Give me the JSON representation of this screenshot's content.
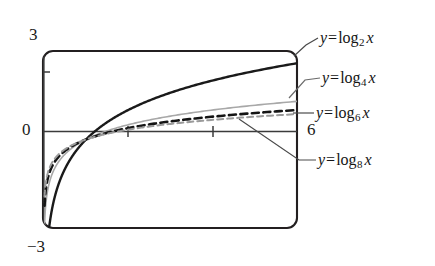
{
  "figure": {
    "kind": "graphing-calculator-plot",
    "background_color": "#ffffff",
    "frame_color": "#231f20",
    "axis_color": "#3b3b3b"
  },
  "axes": {
    "y_top_label": "3",
    "y_zero_label": "0",
    "y_bottom_label": "−3",
    "x_right_label": "6"
  },
  "labels": {
    "log2": {
      "y": "y",
      "equals": "=",
      "fname": "log",
      "base": "2",
      "arg": "x"
    },
    "log4": {
      "y": "y",
      "equals": "=",
      "fname": "log",
      "base": "4",
      "arg": "x"
    },
    "log6": {
      "y": "y",
      "equals": "=",
      "fname": "log",
      "base": "6",
      "arg": "x"
    },
    "log8": {
      "y": "y",
      "equals": "=",
      "fname": "log",
      "base": "8",
      "arg": "x"
    }
  },
  "chart_data": {
    "type": "line",
    "title": "",
    "xlabel": "",
    "ylabel": "",
    "xlim": [
      0,
      6
    ],
    "ylim": [
      -3,
      3
    ],
    "grid": false,
    "legend_position": "right-callouts",
    "x_ticks": [
      2,
      4
    ],
    "y_ticks": [
      2
    ],
    "x_tick_labels": [
      "",
      ""
    ],
    "y_tick_labels": [
      ""
    ],
    "annotations": [
      {
        "text": "3",
        "position": "above-left-of-frame"
      },
      {
        "text": "0",
        "position": "left-of-y-axis-origin"
      },
      {
        "text": "−3",
        "position": "below-left-of-frame"
      },
      {
        "text": "6",
        "position": "right-of-x-axis-end"
      }
    ],
    "series": [
      {
        "name": "y = log_2 x",
        "base": 2,
        "color": "#1a1a1a",
        "style": "solid",
        "width": 2.4,
        "x": [
          0.03,
          0.06,
          0.1,
          0.15,
          0.2,
          0.3,
          0.4,
          0.5,
          0.65,
          0.8,
          1.0,
          1.25,
          1.5,
          1.8,
          2.2,
          2.6,
          3.0,
          3.5,
          4.0,
          4.5,
          5.0,
          5.5,
          6.0
        ],
        "y": [
          -5.06,
          -4.06,
          -3.32,
          -2.74,
          -2.32,
          -1.74,
          -1.32,
          -1.0,
          -0.62,
          -0.32,
          0.0,
          0.32,
          0.58,
          0.85,
          1.14,
          1.38,
          1.58,
          1.81,
          2.0,
          2.17,
          2.32,
          2.46,
          2.58
        ]
      },
      {
        "name": "y = log_4 x",
        "base": 4,
        "color": "#a8a8a8",
        "style": "solid",
        "width": 1.6,
        "x": [
          0.03,
          0.06,
          0.1,
          0.15,
          0.2,
          0.3,
          0.4,
          0.5,
          0.65,
          0.8,
          1.0,
          1.25,
          1.5,
          1.8,
          2.2,
          2.6,
          3.0,
          3.5,
          4.0,
          4.5,
          5.0,
          5.5,
          6.0
        ],
        "y": [
          -2.53,
          -2.03,
          -1.66,
          -1.37,
          -1.16,
          -0.87,
          -0.66,
          -0.5,
          -0.31,
          -0.16,
          0.0,
          0.16,
          0.29,
          0.42,
          0.57,
          0.69,
          0.79,
          0.9,
          1.0,
          1.08,
          1.16,
          1.23,
          1.29
        ]
      },
      {
        "name": "y = log_6 x",
        "base": 6,
        "color": "#141414",
        "style": "dashed",
        "width": 2.6,
        "x": [
          0.03,
          0.06,
          0.1,
          0.15,
          0.2,
          0.3,
          0.4,
          0.5,
          0.65,
          0.8,
          1.0,
          1.25,
          1.5,
          1.8,
          2.2,
          2.6,
          3.0,
          3.5,
          4.0,
          4.5,
          5.0,
          5.5,
          6.0
        ],
        "y": [
          -1.96,
          -1.57,
          -1.29,
          -1.06,
          -0.9,
          -0.67,
          -0.51,
          -0.39,
          -0.24,
          -0.12,
          0.0,
          0.12,
          0.23,
          0.33,
          0.44,
          0.53,
          0.61,
          0.7,
          0.77,
          0.84,
          0.9,
          0.95,
          1.0
        ]
      },
      {
        "name": "y = log_8 x",
        "base": 8,
        "color": "#9a9a9a",
        "style": "dashed",
        "width": 2.0,
        "x": [
          0.03,
          0.06,
          0.1,
          0.15,
          0.2,
          0.3,
          0.4,
          0.5,
          0.65,
          0.8,
          1.0,
          1.25,
          1.5,
          1.8,
          2.2,
          2.6,
          3.0,
          3.5,
          4.0,
          4.5,
          5.0,
          5.5,
          6.0
        ],
        "y": [
          -1.69,
          -1.35,
          -1.11,
          -0.91,
          -0.77,
          -0.58,
          -0.44,
          -0.33,
          -0.21,
          -0.11,
          0.0,
          0.11,
          0.2,
          0.28,
          0.38,
          0.46,
          0.53,
          0.6,
          0.67,
          0.72,
          0.77,
          0.82,
          0.86
        ]
      }
    ]
  }
}
